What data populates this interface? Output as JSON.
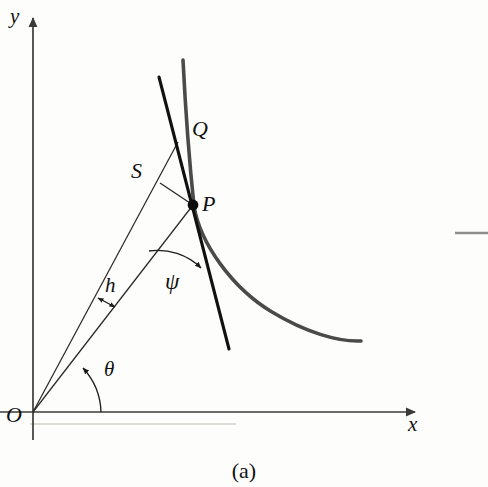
{
  "figure": {
    "caption": "(a)",
    "background_color": "#fdfdfc"
  },
  "axes": {
    "y_label": "y",
    "x_label": "x",
    "origin_label": "O",
    "axis_color": "#3a3a3a"
  },
  "points": {
    "p_label": "P",
    "q_label": "Q",
    "s_label": "S"
  },
  "angles": {
    "theta_label": "θ",
    "psi_label": "ψ"
  },
  "lengths": {
    "h_label": "h"
  },
  "styles": {
    "curve_color": "#4a4a4a",
    "tangent_color": "#111111",
    "thin_line_color": "#2a2a2a",
    "faint_rule_color": "#d8d8d4",
    "margin_rule_color": "#8e8e8e"
  },
  "geometry": {
    "origin": [
      33,
      412
    ],
    "point_p": [
      193,
      205
    ],
    "point_q_anchor": [
      186,
      140
    ],
    "y_axis_top": [
      33,
      13
    ],
    "x_axis_right": [
      421,
      412
    ]
  }
}
